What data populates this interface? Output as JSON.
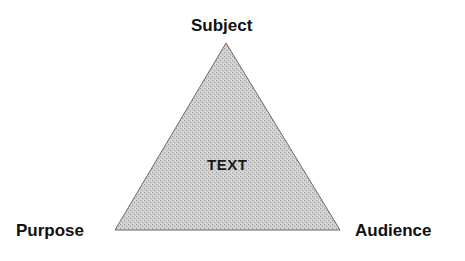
{
  "diagram": {
    "type": "rhetorical-triangle",
    "center_label": "TEXT",
    "vertices": {
      "top": "Subject",
      "bottom_left": "Purpose",
      "bottom_right": "Audience"
    },
    "colors": {
      "fill": "#c9c9c9",
      "stroke": "#6a6a6a",
      "text": "#111111",
      "background": "#ffffff"
    }
  }
}
